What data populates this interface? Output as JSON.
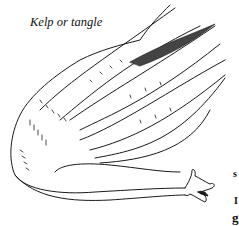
{
  "figure": {
    "caption": "Kelp or tangle",
    "edge_text_fragments": [
      "s",
      "I",
      "g"
    ],
    "ink_color": "#1a1a1a",
    "paper_color": "#ffffff"
  }
}
